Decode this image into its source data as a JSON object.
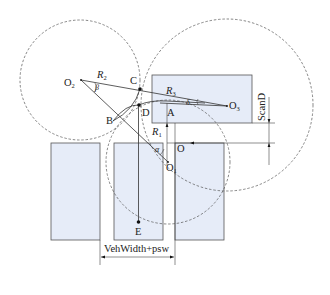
{
  "figure": {
    "type": "geometric-parking-path-diagram",
    "points": {
      "O1": {
        "label": "O",
        "sub": "1"
      },
      "O2": {
        "label": "O",
        "sub": "2"
      },
      "O3": {
        "label": "O",
        "sub": "3"
      },
      "O": {
        "label": "O"
      },
      "A": {
        "label": "A"
      },
      "B": {
        "label": "B"
      },
      "C": {
        "label": "C"
      },
      "D": {
        "label": "D"
      },
      "E": {
        "label": "E"
      }
    },
    "radii": {
      "R1": {
        "label": "R",
        "sub": "1"
      },
      "R2": {
        "label": "R",
        "sub": "2"
      },
      "R3": {
        "label": "R",
        "sub": "3"
      }
    },
    "angles": {
      "alpha": "α",
      "beta": "β",
      "delta": "δ"
    },
    "dimensions": {
      "scan_distance": "ScanD",
      "width_span": "VehWidth+psw"
    },
    "colors": {
      "slot_fill": "#e6ecf8",
      "stroke": "#555555"
    }
  }
}
